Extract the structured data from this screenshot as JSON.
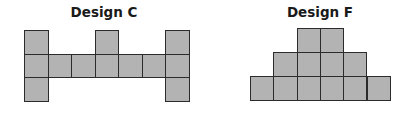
{
  "fill_color": "#b3b3b3",
  "border_color": "#2b2b2b",
  "designs": [
    {
      "id": "design-c",
      "title": "Design C",
      "title_pos": {
        "left": 60,
        "top": 4,
        "width": 88
      },
      "origin": {
        "x": 24,
        "y": 30
      },
      "cell_w": 23.5,
      "cell_h": 23.7,
      "cells": [
        [
          0,
          0
        ],
        [
          3,
          0
        ],
        [
          6,
          0
        ],
        [
          0,
          1
        ],
        [
          1,
          1
        ],
        [
          2,
          1
        ],
        [
          3,
          1
        ],
        [
          4,
          1
        ],
        [
          5,
          1
        ],
        [
          6,
          1
        ],
        [
          0,
          2
        ],
        [
          6,
          2
        ]
      ]
    },
    {
      "id": "design-f",
      "title": "Design F",
      "title_pos": {
        "left": 275,
        "top": 4,
        "width": 90
      },
      "origin": {
        "x": 250,
        "y": 28
      },
      "cell_w": 23.3,
      "cell_h": 24,
      "cells": [
        [
          2,
          0
        ],
        [
          3,
          0
        ],
        [
          1,
          1
        ],
        [
          2,
          1
        ],
        [
          3,
          1
        ],
        [
          4,
          1
        ],
        [
          0,
          2
        ],
        [
          1,
          2
        ],
        [
          2,
          2
        ],
        [
          3,
          2
        ],
        [
          4,
          2
        ],
        [
          5,
          2
        ]
      ]
    }
  ]
}
